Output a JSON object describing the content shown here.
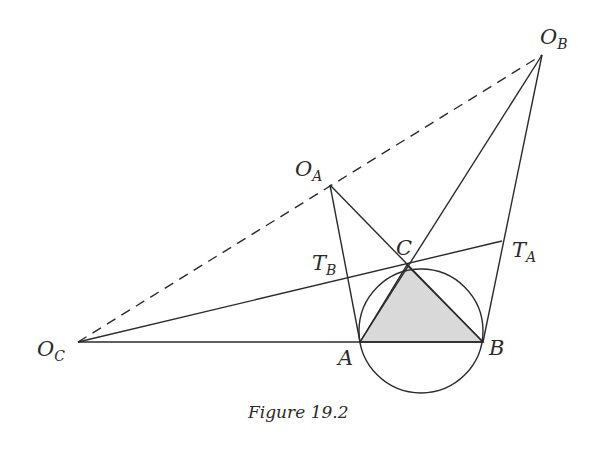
{
  "figure": {
    "caption": "Figure 19.2",
    "points": {
      "A": {
        "label": "A",
        "x": 360,
        "y": 342
      },
      "B": {
        "label": "B",
        "x": 483,
        "y": 342
      },
      "C": {
        "label": "C",
        "x": 407,
        "y": 265
      },
      "OA": {
        "label": "O",
        "sub": "A",
        "x": 330,
        "y": 185
      },
      "OB": {
        "label": "O",
        "sub": "B",
        "x": 542,
        "y": 55
      },
      "OC": {
        "label": "O",
        "sub": "C",
        "x": 78,
        "y": 342
      },
      "TA": {
        "label": "T",
        "sub": "A",
        "x": 502,
        "y": 241
      },
      "TB": {
        "label": "T",
        "sub": "B",
        "x": 347,
        "y": 280
      }
    },
    "circumcircle": {
      "cx": 421,
      "cy": 331,
      "r": 62
    },
    "colors": {
      "stroke": "#2a2a2a",
      "triangle_fill": "#d9d9d9",
      "background": "#ffffff"
    }
  }
}
